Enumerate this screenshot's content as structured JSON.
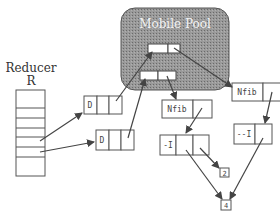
{
  "pool": {
    "title": "Mobile Pool"
  },
  "reducer": {
    "title": "Reducer",
    "name": "R",
    "rows": 8
  },
  "nodes": {
    "d1": {
      "tag": "D"
    },
    "d2": {
      "tag": "D"
    },
    "nfib1": {
      "tag": "Nfib"
    },
    "nfib2": {
      "tag": "Nfib"
    },
    "dec1": {
      "tag": "-I"
    },
    "dec2": {
      "tag": "--I"
    },
    "val2": {
      "value": "2"
    },
    "val4": {
      "value": "4"
    }
  },
  "colors": {
    "pool_fill": "#8a8a8a",
    "stroke": "#555555",
    "arrow": "#444444"
  }
}
